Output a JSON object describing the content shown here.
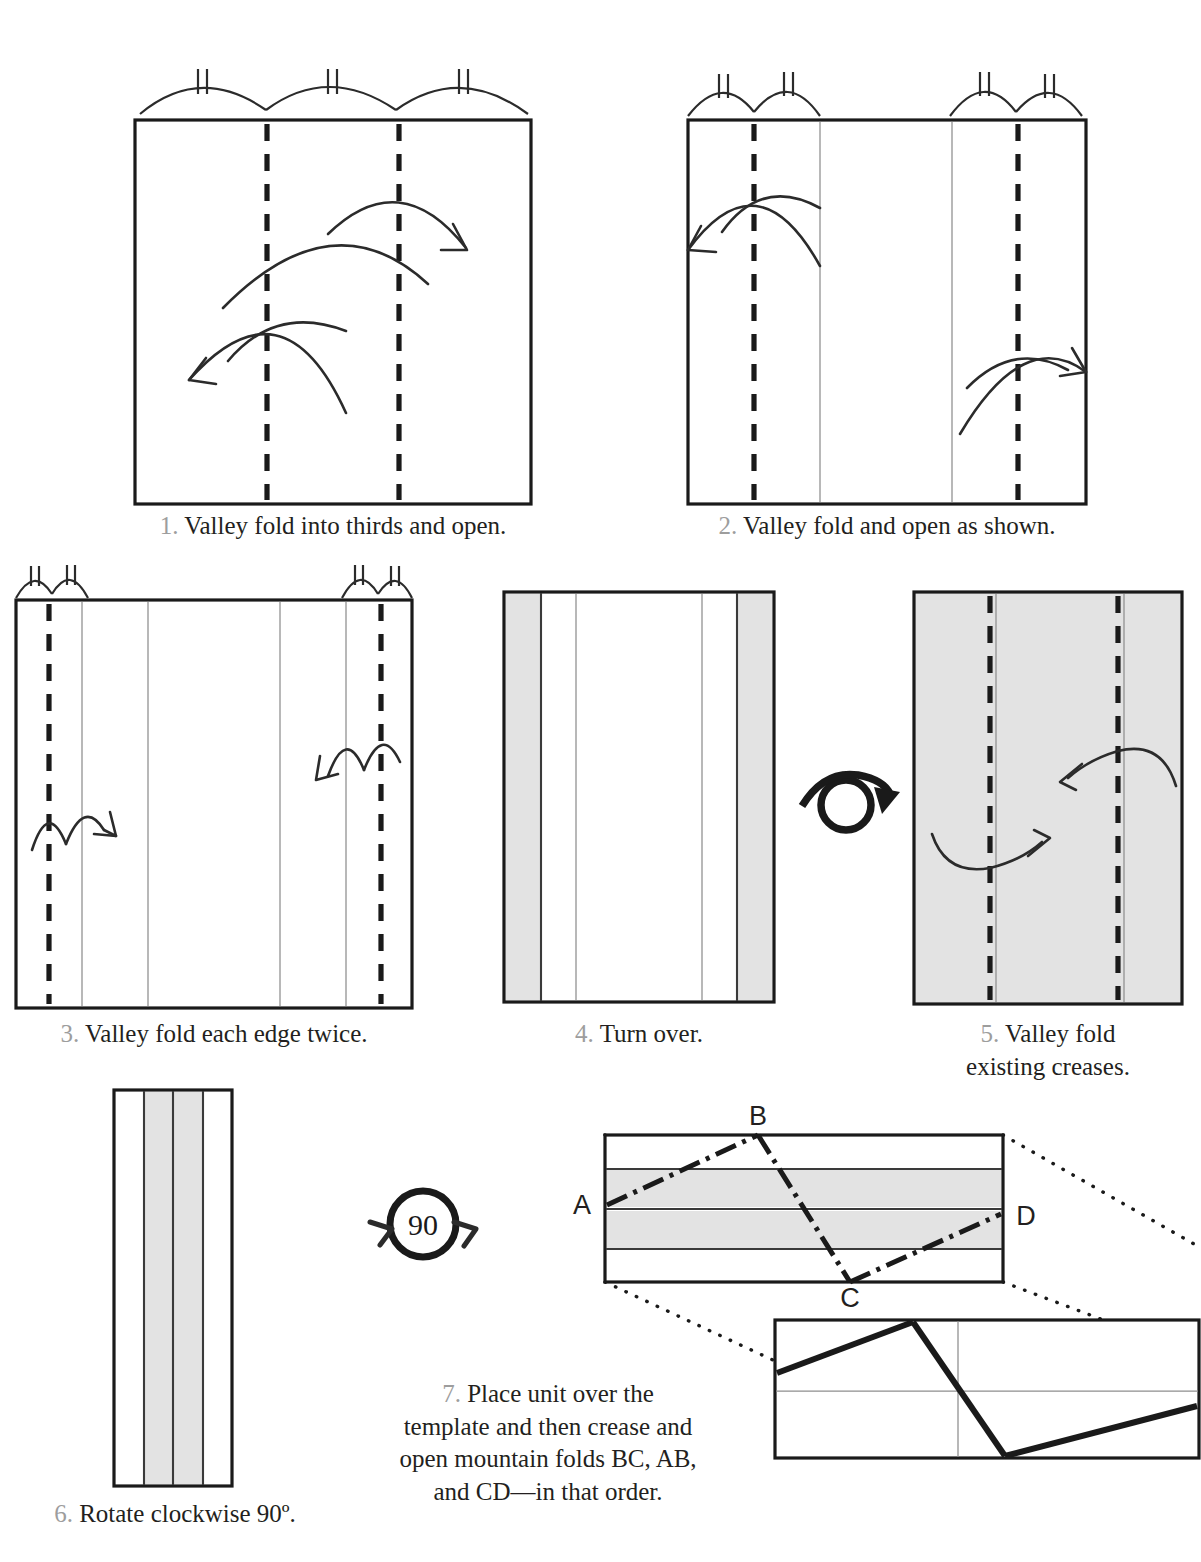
{
  "document": {
    "type": "origami-folding-instructions",
    "title_fragment_cut_off_top": "",
    "paper_fill": "#ffffff",
    "shaded_fill": "#e3e3e3",
    "ink": "#231f20",
    "step_number_color": "#9d9d9d"
  },
  "steps": [
    {
      "id": 1,
      "number": "1.",
      "text": "Valley fold into thirds and open.",
      "lines": [
        "Valley fold into thirds and open."
      ],
      "diagram": {
        "shape": "rectangle",
        "fill": "white",
        "equal_division_arcs": 3,
        "arc_tick_marks": 2,
        "valley_folds_at_fractions": [
          0.3333,
          0.6667
        ],
        "existing_creases": [],
        "arrows": 2
      }
    },
    {
      "id": 2,
      "number": "2.",
      "text": "Valley fold and open as shown.",
      "lines": [
        "Valley fold and open as shown."
      ],
      "diagram": {
        "shape": "rectangle",
        "fill": "white",
        "equal_division_arcs": 4,
        "arc_tick_marks": 2,
        "valley_folds_at_fractions": [
          0.1667,
          0.8333
        ],
        "existing_creases": [
          0.3333,
          0.6667
        ],
        "arrows": 2
      }
    },
    {
      "id": 3,
      "number": "3.",
      "text": "Valley fold each edge twice.",
      "lines": [
        "Valley fold each edge twice."
      ],
      "diagram": {
        "shape": "rectangle",
        "fill": "white",
        "equal_division_arcs": 4,
        "arc_tick_marks": 2,
        "valley_folds_at_fractions": [
          0.0833,
          0.9167
        ],
        "existing_creases": [
          0.1667,
          0.3333,
          0.6667,
          0.8333
        ],
        "arrows": 2
      }
    },
    {
      "id": 4,
      "number": "4.",
      "text": "Turn over.",
      "lines": [
        "Turn over."
      ],
      "diagram": {
        "shape": "rectangle",
        "fill": "white",
        "shaded_bands": [
          [
            0.0,
            0.12
          ],
          [
            0.88,
            1.0
          ]
        ],
        "existing_creases": [
          0.28,
          0.72
        ],
        "heavy_folded_edges": [
          0.12,
          0.88
        ]
      }
    },
    {
      "id": 5,
      "number": "5.",
      "text": "Valley fold existing creases.",
      "lines": [
        "Valley fold",
        "existing creases."
      ],
      "diagram": {
        "shape": "rectangle",
        "fill": "gray",
        "valley_folds_at_fractions": [
          0.26,
          0.74
        ],
        "existing_creases": [
          0.3,
          0.78
        ],
        "arrows": 2
      }
    },
    {
      "id": 6,
      "number": "6.",
      "text": "Rotate clockwise 90º.",
      "lines": [
        "Rotate clockwise 90º."
      ],
      "diagram": {
        "shape": "narrow-strip",
        "bands": [
          "white",
          "gray",
          "gray",
          "white"
        ],
        "heavy_folded_edges": [
          0.25,
          0.5,
          0.75
        ]
      }
    },
    {
      "id": 7,
      "number": "7.",
      "text": "Place unit over the template and then crease and open mountain folds BC, AB, and CD—in that order.",
      "lines": [
        "Place unit over the",
        "template and then crease and",
        "open mountain folds BC, AB,",
        "and CD—in that order."
      ],
      "diagram": {
        "shape": "horizontal-rectangle",
        "shaded_bands": [
          [
            0.22,
            0.48
          ],
          [
            0.52,
            0.78
          ]
        ],
        "mountain_fold_path": [
          "A",
          "B",
          "C",
          "D"
        ],
        "point_labels": [
          {
            "label": "A",
            "position": "left"
          },
          {
            "label": "B",
            "position": "top"
          },
          {
            "label": "C",
            "position": "bottom"
          },
          {
            "label": "D",
            "position": "right"
          }
        ],
        "template_below": {
          "shape": "rectangle",
          "grid": true,
          "heavy_zigzag_folds": true
        },
        "leader_lines": "dotted"
      }
    }
  ],
  "symbols": {
    "turn_over": {
      "name": "turn-over-symbol",
      "between_steps": [
        4,
        5
      ]
    },
    "rotate": {
      "name": "rotate-symbol",
      "value": "90",
      "between_steps": [
        6,
        7
      ]
    }
  }
}
